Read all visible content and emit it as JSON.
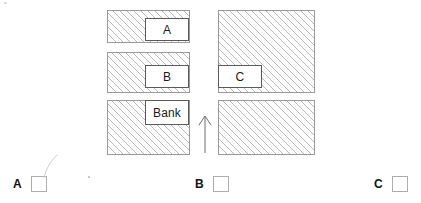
{
  "map": {
    "title": "street-map-diagram",
    "blocks": [
      {
        "id": "left-top",
        "fill": "hatched"
      },
      {
        "id": "left-mid",
        "fill": "hatched"
      },
      {
        "id": "left-bottom",
        "fill": "hatched"
      },
      {
        "id": "right-top",
        "fill": "hatched"
      },
      {
        "id": "right-bottom",
        "fill": "hatched"
      }
    ],
    "labels": {
      "a": "A",
      "b": "B",
      "bank": "Bank",
      "c": "C"
    },
    "arrow": {
      "icon": "arrow-up-icon",
      "direction": "up",
      "meaning": "you-are-here-facing-north"
    },
    "colors": {
      "hatch": "#b9b9b9",
      "outline": "#9a9a9a",
      "label_border": "#5a5a5a",
      "text": "#1a1a1a",
      "checkbox_border": "#adadad",
      "background": "#ffffff"
    }
  },
  "answers": {
    "options": [
      {
        "letter": "A",
        "checked": false
      },
      {
        "letter": "B",
        "checked": false
      },
      {
        "letter": "C",
        "checked": false
      }
    ]
  }
}
